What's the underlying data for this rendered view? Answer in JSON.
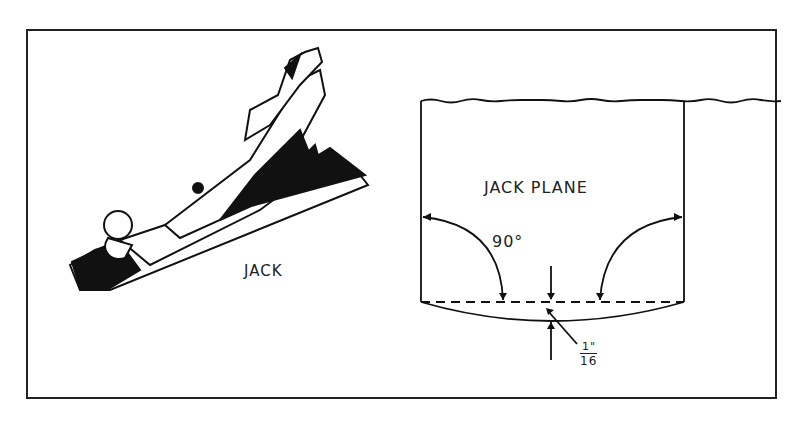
{
  "figure": {
    "left_panel": {
      "label": "JACK"
    },
    "right_panel": {
      "title": "JACK PLANE",
      "angle_label": "90°",
      "curve_depth_numerator": "1\"",
      "curve_depth_denominator": "16"
    }
  },
  "colors": {
    "ink": "#222222",
    "paper": "#ffffff"
  }
}
